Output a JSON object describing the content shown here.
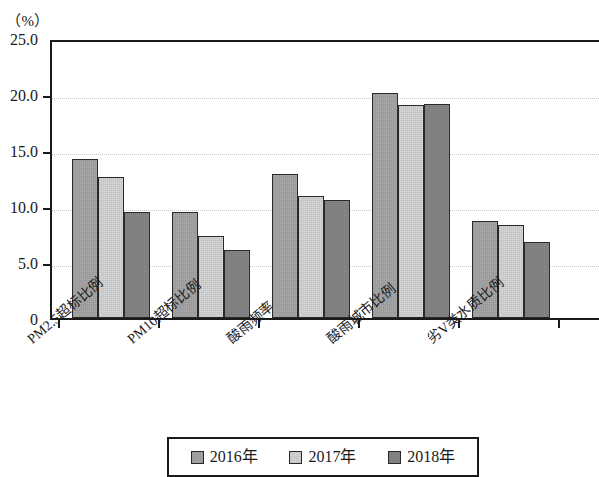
{
  "chart_data": {
    "type": "bar",
    "title": "",
    "subtitle": "",
    "xlabel": "",
    "ylabel": "（%）",
    "unit_label": "（%）",
    "ylim": [
      0,
      25
    ],
    "ytick_labels": [
      "25.0",
      "20.0",
      "15.0",
      "10.0",
      "5.0",
      "0"
    ],
    "ytick_values": [
      25,
      20,
      15,
      10,
      5,
      0
    ],
    "grid": true,
    "grid_axis": "y",
    "legend_position": "bottom",
    "categories": [
      "PM2.5超标比例",
      "PM10超标比例",
      "酸雨频率",
      "酸雨城市比例",
      "劣V类水质比例"
    ],
    "series": [
      {
        "name": "2016年",
        "color": "#a9a9a9",
        "values": [
          14.2,
          9.5,
          12.9,
          20.1,
          8.7
        ]
      },
      {
        "name": "2017年",
        "color": "#d9d9d9",
        "values": [
          12.6,
          7.3,
          10.9,
          19.0,
          8.3
        ]
      },
      {
        "name": "2018年",
        "color": "#898989",
        "values": [
          9.5,
          6.1,
          10.5,
          19.1,
          6.8
        ]
      }
    ]
  },
  "legend": {
    "items": [
      {
        "label": "2016年"
      },
      {
        "label": "2017年"
      },
      {
        "label": "2018年"
      }
    ]
  }
}
